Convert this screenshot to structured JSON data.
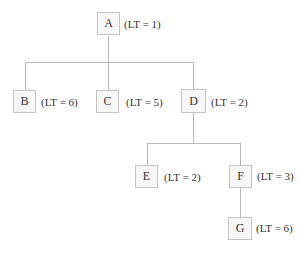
{
  "diagram": {
    "type": "tree",
    "nodes": [
      {
        "id": "A",
        "label": "A",
        "lt": "(LT = 1)"
      },
      {
        "id": "B",
        "label": "B",
        "lt": "(LT = 6)"
      },
      {
        "id": "C",
        "label": "C",
        "lt": "(LT = 5)"
      },
      {
        "id": "D",
        "label": "D",
        "lt": "(LT = 2)"
      },
      {
        "id": "E",
        "label": "E",
        "lt": "(LT = 2)"
      },
      {
        "id": "F",
        "label": "F",
        "lt": "(LT = 3)"
      },
      {
        "id": "G",
        "label": "G",
        "lt": "(LT = 6)"
      }
    ],
    "edges": [
      [
        "A",
        "B"
      ],
      [
        "A",
        "C"
      ],
      [
        "A",
        "D"
      ],
      [
        "D",
        "E"
      ],
      [
        "D",
        "F"
      ],
      [
        "F",
        "G"
      ]
    ]
  }
}
